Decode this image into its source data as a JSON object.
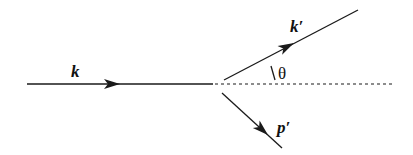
{
  "diagram": {
    "type": "scattering-kinematics",
    "colors": {
      "line": "#1a1a1a",
      "background": "#ffffff"
    },
    "labels": {
      "incoming": "k",
      "outgoing_scattered": "k′",
      "recoil": "p′",
      "angle": "θ"
    },
    "lines": {
      "incoming": {
        "x1": 27,
        "y1": 84,
        "x2": 213,
        "y2": 84,
        "style": "solid"
      },
      "reference_axis": {
        "x1": 213,
        "y1": 84,
        "x2": 392,
        "y2": 84,
        "style": "dotted"
      },
      "scattered": {
        "x1": 224,
        "y1": 80,
        "x2": 358,
        "y2": 10,
        "style": "solid"
      },
      "recoil": {
        "x1": 222,
        "y1": 93,
        "x2": 282,
        "y2": 148,
        "style": "solid"
      }
    }
  }
}
